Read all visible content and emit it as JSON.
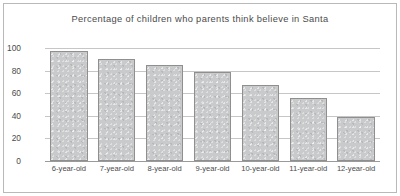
{
  "chart_data": {
    "type": "bar",
    "title": "Percentage of children who parents think believe in Santa",
    "xlabel": "",
    "ylabel": "",
    "categories": [
      "6-year-old",
      "7-year-old",
      "8-year-old",
      "9-year-old",
      "10-year-old",
      "11-year-old",
      "12-year-old"
    ],
    "values": [
      97,
      90,
      85,
      79,
      67,
      56,
      39
    ],
    "ylim": [
      0,
      100
    ],
    "yticks": [
      0,
      20,
      40,
      60,
      80,
      100
    ],
    "ytick_labels": [
      "0",
      "20",
      "40",
      "60",
      "80",
      "100"
    ],
    "grid": "horizontal",
    "legend": "none",
    "colors": {
      "bar_fill": "#c9cacb",
      "bar_edge": "#8f8f8f",
      "gridline": "#c6c6c6",
      "axis": "#9a9a9a",
      "text": "#4b4b4b",
      "frame": "#b9b9b9",
      "background": "#ffffff"
    }
  }
}
